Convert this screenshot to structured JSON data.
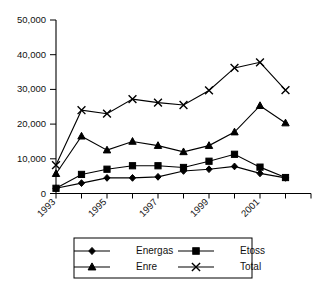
{
  "chart_data": {
    "type": "line",
    "title": "",
    "subtitle": "",
    "xlabel": "",
    "ylabel": "",
    "grid": false,
    "legend_position": "bottom",
    "x": [
      1993,
      1994,
      1995,
      1996,
      1997,
      1998,
      1999,
      2000,
      2001,
      2002
    ],
    "xlim": [
      1993,
      2003
    ],
    "x_tick_values": [
      1993,
      1994,
      1995,
      1996,
      1997,
      1998,
      1999,
      2000,
      2001,
      2002,
      2003
    ],
    "x_tick_labels": [
      "1993",
      "",
      "1995",
      "",
      "1997",
      "",
      "1999",
      "",
      "2001",
      "",
      ""
    ],
    "ylim": [
      0,
      50000
    ],
    "y_tick_values": [
      0,
      10000,
      20000,
      30000,
      40000,
      50000
    ],
    "y_tick_labels": [
      "0",
      "10,000",
      "20,000",
      "30,000",
      "40,000",
      "50,000"
    ],
    "series": [
      {
        "name": "Energas",
        "marker": "diamond",
        "color": "#000000",
        "values": [
          1500,
          3000,
          4500,
          4500,
          4800,
          6500,
          7000,
          7800,
          5800,
          4500
        ]
      },
      {
        "name": "Etoss",
        "marker": "square",
        "color": "#000000",
        "values": [
          1500,
          5500,
          7000,
          8000,
          8000,
          7500,
          9300,
          11300,
          7600,
          4600
        ]
      },
      {
        "name": "Enre",
        "marker": "triangle",
        "color": "#000000",
        "values": [
          5700,
          16500,
          12500,
          15000,
          13800,
          12000,
          13800,
          17700,
          25300,
          20300
        ]
      },
      {
        "name": "Total",
        "marker": "cross",
        "color": "#000000",
        "values": [
          8200,
          24000,
          23000,
          27200,
          26200,
          25500,
          29700,
          36200,
          37800,
          29800
        ]
      }
    ]
  },
  "legend": {
    "entries": [
      {
        "label": "Energas",
        "marker": "diamond"
      },
      {
        "label": "Etoss",
        "marker": "square"
      },
      {
        "label": "Enre",
        "marker": "triangle"
      },
      {
        "label": "Total",
        "marker": "cross"
      }
    ]
  }
}
